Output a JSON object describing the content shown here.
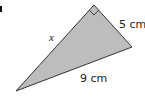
{
  "diagram": {
    "type": "right-triangle",
    "fill_color": "#bdbdbd",
    "stroke_color": "#333333",
    "labels": {
      "hypotenuse_side": "x",
      "short_leg": "5 cm",
      "long_side": "9 cm"
    },
    "right_angle_marker": true
  }
}
